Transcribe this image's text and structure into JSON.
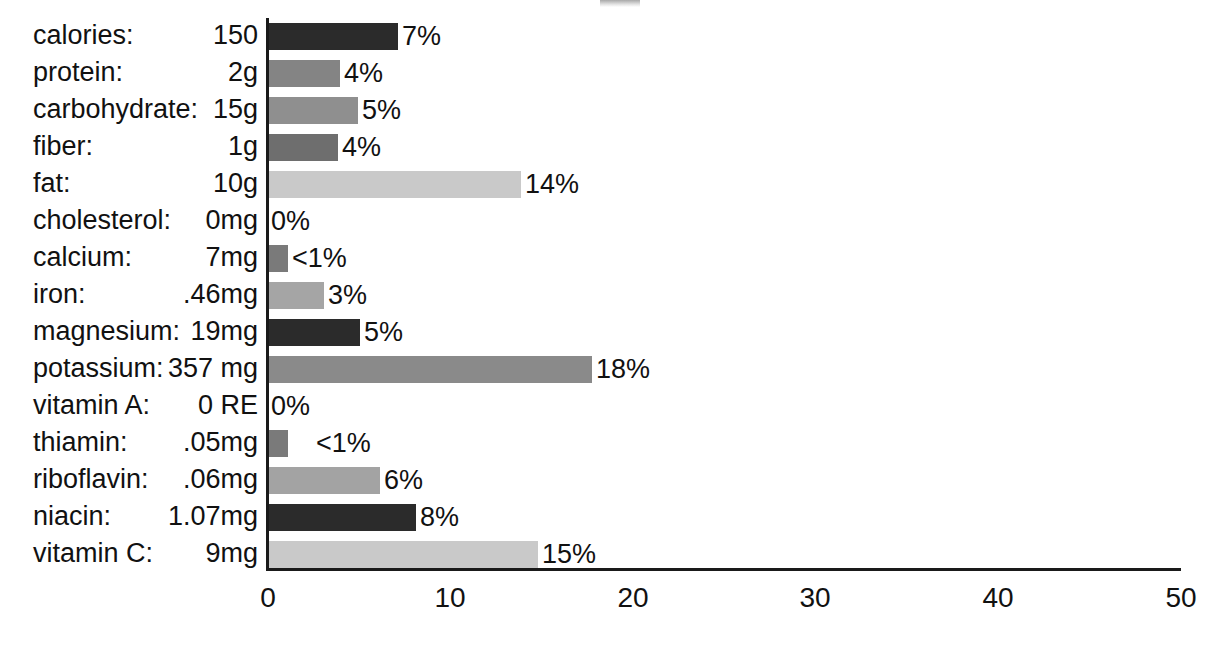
{
  "chart_data": {
    "type": "bar",
    "orientation": "horizontal",
    "title": "",
    "xlabel": "",
    "ylabel": "",
    "xlim": [
      0,
      50
    ],
    "xticks": [
      0,
      10,
      20,
      30,
      40,
      50
    ],
    "grid": false,
    "legend": null,
    "categories": [
      "calories:",
      "protein:",
      "carbohydrate:",
      "fiber:",
      "fat:",
      "cholesterol:",
      "calcium:",
      "iron:",
      "magnesium:",
      "potassium:",
      "vitamin A:",
      "thiamin:",
      "riboflavin:",
      "niacin:",
      "vitamin C:"
    ],
    "amounts": [
      "150",
      "2g",
      "15g",
      "1g",
      "10g",
      "0mg",
      "7mg",
      ".46mg",
      "19mg",
      "357 mg",
      "0 RE",
      ".05mg",
      ".06mg",
      "1.07mg",
      "9mg"
    ],
    "values": [
      7,
      4,
      5,
      4,
      14,
      0,
      1,
      3,
      5,
      18,
      0,
      1,
      6,
      8,
      15
    ],
    "value_labels": [
      "7%",
      "4%",
      "5%",
      "4%",
      "14%",
      "0%",
      "<1%",
      "3%",
      "5%",
      "18%",
      "0%",
      "<1%",
      "6%",
      "8%",
      "15%"
    ],
    "bar_colors": [
      "#2b2b2b",
      "#848484",
      "#8f8f8f",
      "#6e6e6e",
      "#c9c9c9",
      "#ffffff",
      "#7a7a7a",
      "#a5a5a5",
      "#2b2b2b",
      "#8a8a8a",
      "#ffffff",
      "#7a7a7a",
      "#a3a3a3",
      "#2b2b2b",
      "#c9c9c9"
    ],
    "bar_pixel_widths": [
      130,
      72,
      90,
      70,
      253,
      0,
      20,
      56,
      92,
      324,
      0,
      20,
      112,
      148,
      270
    ],
    "label_gap": [
      "normal",
      "normal",
      "normal",
      "normal",
      "normal",
      "none",
      "normal",
      "normal",
      "normal",
      "normal",
      "none",
      "wide",
      "normal",
      "normal",
      "normal"
    ]
  },
  "axis": {
    "ticks": [
      "0",
      "10",
      "20",
      "30",
      "40",
      "50"
    ],
    "tick_positions_px": [
      268,
      450,
      633,
      815,
      998,
      1181
    ]
  },
  "colors": {
    "background": "#ffffff",
    "text": "#111111",
    "axis": "#1a1a1a"
  }
}
